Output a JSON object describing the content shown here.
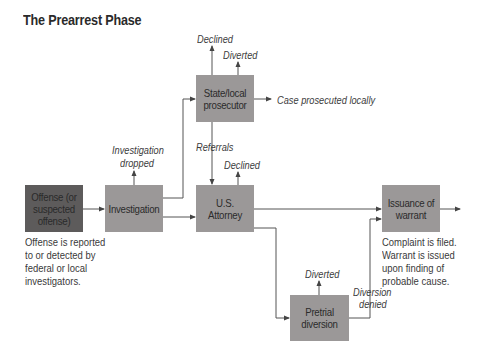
{
  "title": "The Prearrest Phase",
  "boxes": {
    "offense": "Offense (or suspected offense)",
    "investigation": "Investigation",
    "state_prosecutor": "State/local prosecutor",
    "us_attorney": "U.S. Attorney",
    "pretrial": "Pretrial diversion",
    "warrant": "Issuance of warrant"
  },
  "labels": {
    "declined_state": "Declined",
    "diverted_state": "Diverted",
    "case_local": "Case prosecuted locally",
    "investigation_dropped_1": "Investigation",
    "investigation_dropped_2": "dropped",
    "referrals": "Referrals",
    "declined_us": "Declined",
    "diverted_pretrial": "Diverted",
    "diversion_denied_1": "Diversion",
    "diversion_denied_2": "denied"
  },
  "notes": {
    "offense": [
      "Offense is reported",
      "to or detected by",
      "federal or local",
      "investigators."
    ],
    "warrant": [
      "Complaint is filed.",
      "Warrant is issued",
      "upon finding of",
      "probable cause."
    ]
  },
  "colors": {
    "offense_box": "#5d5b5b",
    "process_box": "#9b9898",
    "line": "#555555"
  }
}
